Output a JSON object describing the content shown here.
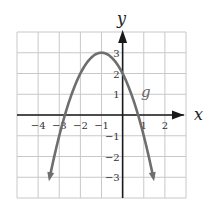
{
  "chart_data": {
    "type": "line",
    "title": "",
    "xlabel": "x",
    "ylabel": "y",
    "xlim": [
      -5,
      3
    ],
    "ylim": [
      -4,
      4
    ],
    "grid": true,
    "x_ticks": [
      -4,
      -3,
      -2,
      -1,
      1,
      2
    ],
    "y_ticks": [
      -3,
      -2,
      -1,
      1,
      2,
      3
    ],
    "x_tick_labels": [
      "−4",
      "−3",
      "−2",
      "−1",
      "1",
      "2"
    ],
    "y_tick_labels": [
      "−3",
      "−2",
      "−1",
      "1",
      "2",
      "3"
    ],
    "series": [
      {
        "name": "g",
        "equation": "g(x) = -(x+1)^2 + 3",
        "vertex": [
          -1,
          3
        ],
        "y_intercept": 2,
        "x_intercepts": [
          -2.73,
          0.73
        ],
        "x": [
          -3.4,
          -3,
          -2.5,
          -2,
          -1.5,
          -1,
          -0.5,
          0,
          0.5,
          1,
          1.4
        ],
        "values": [
          -2.76,
          -1,
          0.75,
          2,
          2.75,
          3,
          2.75,
          2,
          0.75,
          -1,
          -2.76
        ],
        "color": "#6e6e6e",
        "arrows_at_ends": true
      }
    ],
    "annotations": [
      {
        "text": "g",
        "x": 1,
        "y": 1
      }
    ]
  },
  "labels": {
    "x_axis": "x",
    "y_axis": "y",
    "function": "g"
  },
  "colors": {
    "grid": "#c8c8c8",
    "axis": "#1a1a1a",
    "curve": "#6e6e6e"
  }
}
